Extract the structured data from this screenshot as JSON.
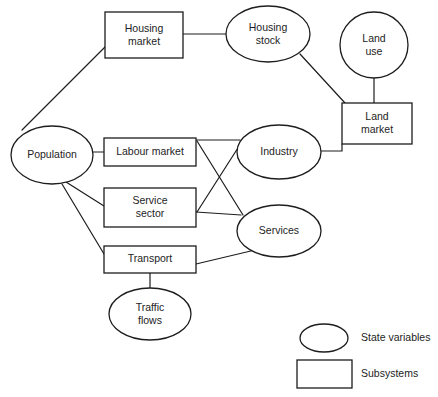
{
  "diagram": {
    "type": "system-relationship-diagram",
    "background_color": "#ffffff",
    "stroke_color": "#1d1d1d",
    "nodes": [
      {
        "id": "housing_market",
        "label_line1": "Housing",
        "label_line2": "market",
        "shape": "rect",
        "category": "Subsystems",
        "x": 105,
        "y": 12,
        "w": 78,
        "h": 46
      },
      {
        "id": "housing_stock",
        "label_line1": "Housing",
        "label_line2": "stock",
        "shape": "ellipse",
        "category": "State variables",
        "cx": 268,
        "cy": 34,
        "rx": 42,
        "ry": 28
      },
      {
        "id": "land_use",
        "label_line1": "Land",
        "label_line2": "use",
        "shape": "ellipse",
        "category": "State variables",
        "cx": 374,
        "cy": 45,
        "rx": 34,
        "ry": 33
      },
      {
        "id": "land_market",
        "label_line1": "Land",
        "label_line2": "market",
        "shape": "rect",
        "category": "Subsystems",
        "x": 342,
        "y": 103,
        "w": 70,
        "h": 41
      },
      {
        "id": "population",
        "label_line1": "Population",
        "label_line2": "",
        "shape": "ellipse",
        "category": "State variables",
        "cx": 52,
        "cy": 155,
        "rx": 41,
        "ry": 29
      },
      {
        "id": "labour_market",
        "label_line1": "Labour market",
        "label_line2": "",
        "shape": "rect",
        "category": "Subsystems",
        "x": 104,
        "y": 138,
        "w": 92,
        "h": 28
      },
      {
        "id": "industry",
        "label_line1": "Industry",
        "label_line2": "",
        "shape": "ellipse",
        "category": "State variables",
        "cx": 279,
        "cy": 152,
        "rx": 42,
        "ry": 27
      },
      {
        "id": "service_sector",
        "label_line1": "Service",
        "label_line2": "sector",
        "shape": "rect",
        "category": "Subsystems",
        "x": 104,
        "y": 188,
        "w": 92,
        "h": 39
      },
      {
        "id": "services",
        "label_line1": "Services",
        "label_line2": "",
        "shape": "ellipse",
        "category": "State variables",
        "cx": 279,
        "cy": 231,
        "rx": 42,
        "ry": 26
      },
      {
        "id": "transport",
        "label_line1": "Transport",
        "label_line2": "",
        "shape": "rect",
        "category": "Subsystems",
        "x": 104,
        "y": 246,
        "w": 92,
        "h": 27
      },
      {
        "id": "traffic_flows",
        "label_line1": "Traffic",
        "label_line2": "flows",
        "shape": "ellipse",
        "category": "State variables",
        "cx": 150,
        "cy": 314,
        "rx": 41,
        "ry": 26
      }
    ],
    "edges": [
      {
        "id": "edge-population-housing-market",
        "from": "population",
        "to": "housing_market",
        "points": "22,130 105,47"
      },
      {
        "id": "edge-housing-market-housing-stock",
        "from": "housing_market",
        "to": "housing_stock",
        "points": "183,34 226,34"
      },
      {
        "id": "edge-housing-stock-land-market",
        "from": "housing_stock",
        "to": "land_market",
        "points": "300,54 345,103"
      },
      {
        "id": "edge-land-use-land-market",
        "from": "land_use",
        "to": "land_market",
        "points": "374,78 374,103"
      },
      {
        "id": "edge-population-labour-market",
        "from": "population",
        "to": "labour_market",
        "points": "93,152 104,152"
      },
      {
        "id": "edge-labour-market-industry",
        "from": "labour_market",
        "to": "industry",
        "points": "196,140 240,140"
      },
      {
        "id": "edge-industry-land-market",
        "from": "industry",
        "to": "land_market",
        "points": "321,151 342,151 342,144"
      },
      {
        "id": "edge-labour-market-services",
        "from": "labour_market",
        "to": "services",
        "points": "197,141 243,215"
      },
      {
        "id": "edge-service-sector-industry",
        "from": "service_sector",
        "to": "industry",
        "points": "197,212 243,140"
      },
      {
        "id": "edge-service-sector-services",
        "from": "service_sector",
        "to": "services",
        "points": "196,212 241,215"
      },
      {
        "id": "edge-population-service-sector",
        "from": "population",
        "to": "service_sector",
        "points": "66,182 104,206"
      },
      {
        "id": "edge-population-transport",
        "from": "population",
        "to": "transport",
        "points": "62,184 104,254"
      },
      {
        "id": "edge-transport-services",
        "from": "transport",
        "to": "services",
        "points": "196,264 255,250"
      },
      {
        "id": "edge-transport-traffic-flows",
        "from": "transport",
        "to": "traffic_flows",
        "points": "150,273 150,288"
      }
    ],
    "legend": {
      "items": [
        {
          "id": "legend-state-variables",
          "shape": "ellipse",
          "label": "State variables",
          "cx": 324,
          "cy": 338,
          "rx": 24,
          "ry": 14,
          "text_x": 361,
          "text_y": 338
        },
        {
          "id": "legend-subsystems",
          "shape": "rect",
          "label": "Subsystems",
          "x": 297,
          "y": 360,
          "w": 55,
          "h": 28,
          "text_x": 361,
          "text_y": 374
        }
      ]
    }
  }
}
